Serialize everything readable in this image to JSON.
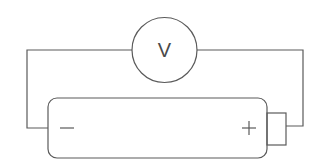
{
  "diagram": {
    "type": "circuit",
    "components": {
      "voltmeter": {
        "symbol": "V",
        "cx": 164.5,
        "cy": 50,
        "r": 32.5
      },
      "battery": {
        "x": 48,
        "y": 98,
        "width": 219,
        "height": 60,
        "rx": 9,
        "negative_label": "−",
        "positive_label": "+",
        "terminal": {
          "x": 267,
          "y": 113,
          "width": 19,
          "height": 32
        }
      }
    },
    "wires": [
      {
        "name": "left-wire",
        "points": "132,50 27,50 27,128 48,128"
      },
      {
        "name": "right-wire",
        "points": "197,50 303,50 303,126 286,126"
      }
    ],
    "stroke_color": "#5a5a5a"
  }
}
